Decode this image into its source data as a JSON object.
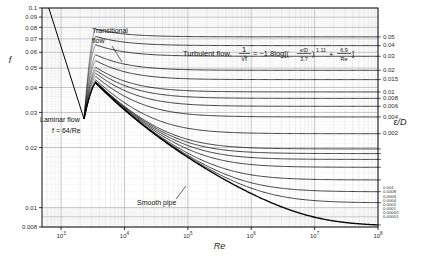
{
  "figure": {
    "type": "moody-chart",
    "background": "#ffffff",
    "plot_area": {
      "left": 42,
      "top": 8,
      "right": 378,
      "bottom": 227
    }
  },
  "axes": {
    "x": {
      "label": "Re",
      "scale": "log",
      "min": 500,
      "max": 100000000,
      "tick_labels": [
        "10³",
        "10⁴",
        "10⁵",
        "10⁶",
        "10⁷",
        "10⁸"
      ],
      "tick_values": [
        1000,
        10000,
        100000,
        1000000,
        10000000,
        100000000
      ],
      "tick_mantissa": [
        "10",
        "10",
        "10",
        "10",
        "10",
        "10"
      ],
      "tick_exponent": [
        "3",
        "4",
        "5",
        "6",
        "7",
        "8"
      ]
    },
    "y": {
      "label": "f",
      "scale": "log",
      "min": 0.008,
      "max": 0.1,
      "tick_labels": [
        "0.1",
        "0.09",
        "0.08",
        "0.07",
        "0.06",
        "0.05",
        "0.04",
        "0.03",
        "0.02",
        "0.01",
        "0.008"
      ],
      "tick_values": [
        0.1,
        0.09,
        0.08,
        0.07,
        0.06,
        0.05,
        0.04,
        0.03,
        0.02,
        0.01,
        0.008
      ]
    },
    "right": {
      "label": "ε/D",
      "tick_labels": [
        "0.05",
        "0.04",
        "0.03",
        "0.02",
        "0.015",
        "0.01",
        "0.008",
        "0.006",
        "0.004",
        "0.002",
        "0.001",
        "0.0008",
        "0.0006",
        "0.0004",
        "0.0002",
        "0.0001",
        "0.00005",
        "0.00001"
      ]
    }
  },
  "annotations": {
    "laminar": {
      "line1": "Laminar flow",
      "line2": "f = 64/Re"
    },
    "transitional": {
      "line1": "Transitional",
      "line2": "flow"
    },
    "smooth_pipe": "Smooth pipe",
    "turbulent": {
      "prefix": "Turbulent flow,",
      "lhs_num": "1",
      "lhs_den": "√f",
      "equals": "= −1.8log[(",
      "eps_num": "ε/D",
      "eps_den": "3.7",
      "exponent": "1.11",
      "plus": "+",
      "frac2_num": "6.9",
      "frac2_den": "Re",
      "close": "]"
    }
  },
  "chart_data": {
    "type": "line",
    "title": "",
    "xlabel": "Re",
    "ylabel": "f",
    "xlim": [
      500,
      100000000
    ],
    "ylim": [
      0.008,
      0.1
    ],
    "grid": true,
    "legend": "right-axis relative roughness labels",
    "series": [
      {
        "name": "Laminar flow f = 64/Re",
        "x": [
          640,
          2300
        ],
        "values": [
          0.1,
          0.0278
        ]
      },
      {
        "name": "eps/D = 0.05",
        "x": [
          3500,
          10000,
          100000,
          1000000,
          10000000,
          100000000
        ],
        "values": [
          0.0793,
          0.076,
          0.0733,
          0.0725,
          0.0724,
          0.0724
        ]
      },
      {
        "name": "eps/D = 0.04",
        "x": [
          3500,
          10000,
          100000,
          1000000,
          10000000,
          100000000
        ],
        "values": [
          0.0735,
          0.0697,
          0.0663,
          0.0655,
          0.0653,
          0.0653
        ]
      },
      {
        "name": "eps/D = 0.03",
        "x": [
          3500,
          10000,
          100000,
          1000000,
          10000000,
          100000000
        ],
        "values": [
          0.0673,
          0.0627,
          0.0586,
          0.0575,
          0.0574,
          0.0574
        ]
      },
      {
        "name": "eps/D = 0.02",
        "x": [
          3500,
          10000,
          100000,
          1000000,
          10000000,
          100000000
        ],
        "values": [
          0.0601,
          0.0546,
          0.0491,
          0.0478,
          0.0477,
          0.0477
        ]
      },
      {
        "name": "eps/D = 0.015",
        "x": [
          3500,
          10000,
          100000,
          1000000,
          10000000,
          100000000
        ],
        "values": [
          0.0561,
          0.05,
          0.0434,
          0.042,
          0.0418,
          0.0418
        ]
      },
      {
        "name": "eps/D = 0.01",
        "x": [
          3500,
          10000,
          100000,
          1000000,
          10000000,
          100000000
        ],
        "values": [
          0.0516,
          0.0448,
          0.0369,
          0.035,
          0.0348,
          0.0348
        ]
      },
      {
        "name": "eps/D = 0.008",
        "x": [
          3500,
          10000,
          100000,
          1000000,
          10000000,
          100000000
        ],
        "values": [
          0.0496,
          0.0425,
          0.0339,
          0.0317,
          0.0315,
          0.0315
        ]
      },
      {
        "name": "eps/D = 0.006",
        "x": [
          3500,
          10000,
          100000,
          1000000,
          10000000,
          100000000
        ],
        "values": [
          0.0474,
          0.04,
          0.0305,
          0.0279,
          0.0277,
          0.0277
        ]
      },
      {
        "name": "eps/D = 0.004",
        "x": [
          3500,
          10000,
          100000,
          1000000,
          10000000,
          100000000
        ],
        "values": [
          0.045,
          0.0372,
          0.0266,
          0.0234,
          0.0231,
          0.0231
        ]
      },
      {
        "name": "eps/D = 0.002",
        "x": [
          3500,
          10000,
          100000,
          1000000,
          10000000,
          100000000
        ],
        "values": [
          0.0419,
          0.0336,
          0.0214,
          0.0172,
          0.0168,
          0.0167
        ]
      },
      {
        "name": "eps/D = 0.001",
        "x": [
          3500,
          10000,
          100000,
          1000000,
          10000000,
          100000000
        ],
        "values": [
          0.0402,
          0.0314,
          0.0182,
          0.0132,
          0.0126,
          0.0126
        ]
      },
      {
        "name": "eps/D = 0.0008",
        "x": [
          3500,
          10000,
          100000,
          1000000,
          10000000,
          100000000
        ],
        "values": [
          0.0399,
          0.031,
          0.0176,
          0.0124,
          0.0118,
          0.0117
        ]
      },
      {
        "name": "eps/D = 0.0006",
        "x": [
          3500,
          10000,
          100000,
          1000000,
          10000000,
          100000000
        ],
        "values": [
          0.0396,
          0.0305,
          0.0169,
          0.0114,
          0.0107,
          0.0106
        ]
      },
      {
        "name": "eps/D = 0.0004",
        "x": [
          3500,
          10000,
          100000,
          1000000,
          10000000,
          100000000
        ],
        "values": [
          0.0392,
          0.03,
          0.0162,
          0.0104,
          0.00956,
          0.00947
        ]
      },
      {
        "name": "eps/D = 0.0002",
        "x": [
          3500,
          10000,
          100000,
          1000000,
          10000000,
          100000000
        ],
        "values": [
          0.0389,
          0.0295,
          0.0153,
          0.00907,
          0.0081,
          0.00799
        ]
      },
      {
        "name": "eps/D = 0.0001",
        "x": [
          3500,
          10000,
          100000,
          1000000,
          10000000,
          100000000
        ],
        "values": [
          0.0387,
          0.0292,
          0.0148,
          0.00836,
          0.00724,
          0.0071
        ]
      },
      {
        "name": "eps/D = 0.00005",
        "x": [
          3500,
          10000,
          100000,
          1000000,
          10000000,
          100000000
        ],
        "values": [
          0.0386,
          0.0291,
          0.0146,
          0.00797,
          0.00672,
          0.00655
        ]
      },
      {
        "name": "eps/D = 0.00001 (smooth pipe)",
        "x": [
          3500,
          10000,
          100000,
          1000000,
          10000000,
          100000000
        ],
        "values": [
          0.0385,
          0.0289,
          0.0143,
          0.0076,
          0.00612,
          0.00586
        ]
      }
    ]
  }
}
